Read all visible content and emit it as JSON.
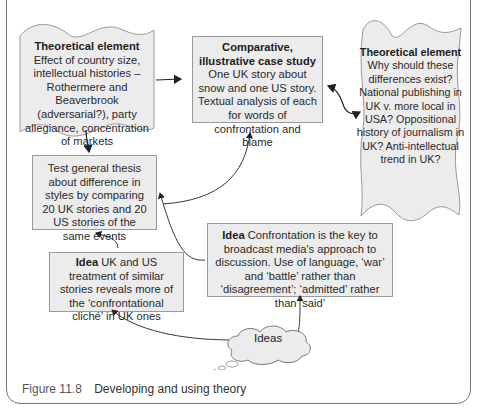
{
  "diagram": {
    "nodes": {
      "theory_left": {
        "heading": "Theoretical element",
        "text": "Effect of country size, intellectual histories – Rothermere and Beaverbrook (adversarial?), party allegiance, concentration of markets"
      },
      "case_study": {
        "heading": "Comparative, illustrative case study",
        "text": "One UK story about snow and one US story. Textual analysis of each for words of confrontation and blame"
      },
      "theory_right": {
        "heading": "Theoretical element",
        "text": "Why should these differences exist? National publishing in UK v. more local in USA? Oppositional history of journalism in UK? Anti-intellectual trend in UK?"
      },
      "test_thesis": {
        "text": "Test general thesis about difference in styles by comparing 20 UK stories and 20 US stories of the same events"
      },
      "idea_confrontation": {
        "heading": "Idea",
        "text": "Confrontation is the key to broadcast media's approach to discussion. Use of language, ‘war’ and ‘battle’ rather than ‘disagreement’; ‘admitted’ rather than ‘said’"
      },
      "idea_uk_us": {
        "heading": "Idea",
        "text": "UK and US treatment of similar stories reveals more of the ‘confrontational cliché’ in UK ones"
      },
      "ideas_cloud": {
        "label": "Ideas"
      }
    },
    "edges": [
      {
        "from": "theory_left",
        "to": "case_study"
      },
      {
        "from": "theory_left",
        "to": "test_thesis"
      },
      {
        "from": "case_study",
        "to": "theory_right",
        "bidirectional": true
      },
      {
        "from": "test_thesis",
        "to": "case_study"
      },
      {
        "from": "idea_confrontation",
        "to": "test_thesis"
      },
      {
        "from": "idea_uk_us",
        "to": "test_thesis"
      },
      {
        "from": "ideas_cloud",
        "to": "idea_confrontation"
      },
      {
        "from": "ideas_cloud",
        "to": "idea_uk_us"
      }
    ]
  },
  "caption": {
    "number": "Figure 11.8",
    "title": "Developing and using theory"
  },
  "colors": {
    "box_fill": "#ececec",
    "box_border": "#9a9a9a",
    "line": "#222222"
  }
}
